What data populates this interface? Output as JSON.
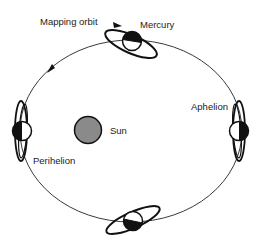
{
  "diagram": {
    "labels": {
      "mapping_orbit": "Mapping orbit",
      "mercury": "Mercury",
      "aphelion": "Aphelion",
      "sun": "Sun",
      "perihelion": "Perihelion"
    },
    "colors": {
      "line": "#111111",
      "sun_fill": "#8a8a8a",
      "background": "#ffffff"
    },
    "nodes": [
      {
        "name": "Mercury (top)",
        "position": "top"
      },
      {
        "name": "Aphelion",
        "position": "right"
      },
      {
        "name": "Perihelion",
        "position": "left"
      },
      {
        "name": "Mercury (bottom)",
        "position": "bottom"
      },
      {
        "name": "Sun",
        "position": "center-left"
      }
    ]
  }
}
